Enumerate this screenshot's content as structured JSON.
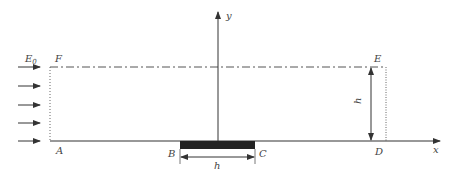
{
  "diagram": {
    "colors": {
      "line": "#333333",
      "plate": "#222222",
      "text": "#444444",
      "dotted": "#666666"
    },
    "labels": {
      "field": "E",
      "field_sub": "0",
      "A": "A",
      "B": "B",
      "C": "C",
      "D": "D",
      "E": "E",
      "F": "F",
      "x_axis": "x",
      "y_axis": "y",
      "plate_width": "h",
      "height_dim": "h"
    },
    "incident_arrows_count": 5
  }
}
